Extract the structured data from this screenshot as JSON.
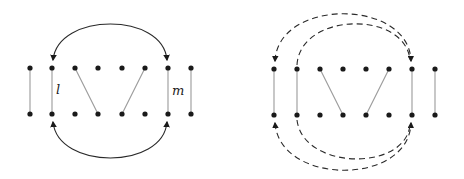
{
  "figure": {
    "left": {
      "dots_x": [
        30,
        52,
        75,
        98,
        122,
        145,
        168,
        191
      ],
      "top_y": 68,
      "bottom_y": 114,
      "labels": {
        "l": "l",
        "m": "m"
      },
      "arc_style": "solid"
    },
    "right": {
      "dots_x": [
        274,
        297,
        320,
        343,
        366,
        389,
        412,
        435
      ],
      "top_y": 69,
      "bottom_y": 115,
      "arc_style": "dashed"
    }
  }
}
